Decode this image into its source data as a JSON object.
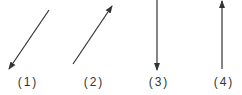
{
  "diagram": {
    "color": "#333333",
    "arrows": [
      {
        "id": 1,
        "label": "(1)",
        "direction": "down-left"
      },
      {
        "id": 2,
        "label": "(2)",
        "direction": "up-right"
      },
      {
        "id": 3,
        "label": "(3)",
        "direction": "down"
      },
      {
        "id": 4,
        "label": "(4)",
        "direction": "up"
      }
    ]
  }
}
